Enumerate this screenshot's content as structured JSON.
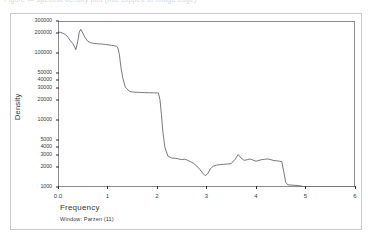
{
  "top_clipped_caption": "Figure — spectral density plot (title clipped at image edge)",
  "chart_data": {
    "type": "line",
    "title": "",
    "xlabel": "Frequency",
    "ylabel": "Density",
    "footnote": "Window: Parzen (11)",
    "yscale": "log",
    "grid": false,
    "legend": "none",
    "line_color": "#555560",
    "frame_color": "#8a8a90",
    "xlim": [
      0.0,
      6.0
    ],
    "ylim": [
      1000,
      300000
    ],
    "xticks": [
      0.0,
      1,
      2,
      3,
      4,
      5,
      6
    ],
    "xticklabels": [
      "0.0",
      "1",
      "2",
      "3",
      "4",
      "5",
      "6"
    ],
    "yticks": [
      300000,
      200000,
      100000,
      50000,
      40000,
      30000,
      20000,
      10000,
      5000,
      4000,
      3000,
      2000,
      1000
    ],
    "yticklabels": [
      "300000",
      "200000",
      "100000",
      "50000",
      "40000",
      "30000",
      "20000",
      "10000",
      "5000",
      "4000",
      "3000",
      "2000",
      "1000"
    ],
    "x": [
      0.0,
      0.05,
      0.1,
      0.15,
      0.2,
      0.25,
      0.3,
      0.33,
      0.36,
      0.4,
      0.43,
      0.46,
      0.5,
      0.55,
      0.6,
      0.65,
      0.72,
      0.8,
      0.88,
      0.96,
      1.02,
      1.08,
      1.14,
      1.18,
      1.21,
      1.24,
      1.27,
      1.31,
      1.36,
      1.45,
      1.55,
      1.65,
      1.75,
      1.85,
      1.95,
      2.0,
      2.03,
      2.06,
      2.09,
      2.12,
      2.16,
      2.22,
      2.3,
      2.38,
      2.44,
      2.5,
      2.56,
      2.62,
      2.68,
      2.74,
      2.8,
      2.86,
      2.92,
      2.97,
      3.02,
      3.08,
      3.14,
      3.2,
      3.26,
      3.34,
      3.42,
      3.5,
      3.58,
      3.64,
      3.7,
      3.76,
      3.82,
      3.88,
      3.94,
      4.0,
      4.06,
      4.12,
      4.18,
      4.24,
      4.3,
      4.36,
      4.42,
      4.48,
      4.52,
      4.56,
      4.6,
      4.64,
      4.7,
      4.78,
      4.86,
      4.92,
      4.96,
      5.0,
      5.1,
      5.3,
      5.6,
      6.0
    ],
    "y": [
      205000,
      203000,
      197000,
      188000,
      172000,
      152000,
      138000,
      125000,
      112000,
      150000,
      205000,
      225000,
      198000,
      168000,
      150000,
      143000,
      139000,
      137000,
      136000,
      134000,
      132000,
      130000,
      128000,
      126000,
      120000,
      95000,
      62000,
      42000,
      31000,
      26500,
      26000,
      25800,
      25600,
      25500,
      25400,
      25300,
      25200,
      20000,
      12000,
      6500,
      3900,
      2900,
      2700,
      2680,
      2620,
      2560,
      2600,
      2500,
      2380,
      2260,
      2060,
      1850,
      1620,
      1480,
      1560,
      1880,
      2050,
      2120,
      2150,
      2180,
      2200,
      2240,
      2600,
      3050,
      2700,
      2500,
      2550,
      2620,
      2520,
      2420,
      2500,
      2560,
      2600,
      2620,
      2560,
      2480,
      2460,
      2420,
      2400,
      1700,
      1180,
      1080,
      1070,
      1060,
      1050,
      1030,
      1010,
      1000,
      1000,
      1000,
      1000,
      1000
    ]
  }
}
